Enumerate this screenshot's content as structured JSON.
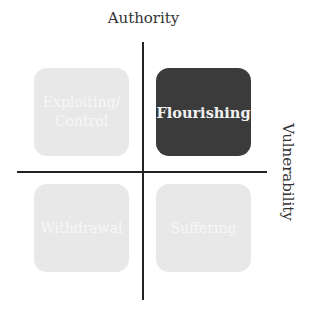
{
  "axes": {
    "vertical_label": "Authority",
    "horizontal_label": "Vulnerability"
  },
  "quadrants": [
    {
      "position": "top-left",
      "label": "Exploiting/ Control",
      "line1": "Exploiting/",
      "line2": "Control",
      "style": "light",
      "fill": "#e8e8e8"
    },
    {
      "position": "top-right",
      "label": "Flourishing",
      "line1": "Flourishing",
      "line2": "",
      "style": "dark",
      "fill": "#3b3b3b"
    },
    {
      "position": "bottom-left",
      "label": "Withdrawal",
      "line1": "Withdrawal",
      "line2": "",
      "style": "light",
      "fill": "#e8e8e8"
    },
    {
      "position": "bottom-right",
      "label": "Suffering",
      "line1": "Suffering",
      "line2": "",
      "style": "light",
      "fill": "#e8e8e8"
    }
  ],
  "colors": {
    "axis_line": "#222222",
    "highlight": "#3b3b3b",
    "muted": "#e8e8e8"
  }
}
